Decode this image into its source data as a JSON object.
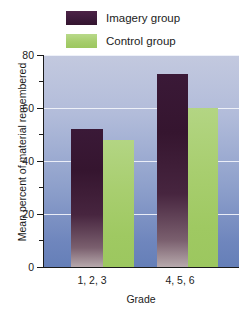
{
  "chart_data": {
    "type": "bar",
    "title": "",
    "xlabel": "Grade",
    "ylabel": "Mean percent of material remembered",
    "categories": [
      "1, 2, 3",
      "4, 5, 6"
    ],
    "series": [
      {
        "name": "Imagery group",
        "color": "#3a1937",
        "values": [
          52,
          73
        ]
      },
      {
        "name": "Control group",
        "color": "#a6cd6c",
        "values": [
          48,
          60
        ]
      }
    ],
    "ylim": [
      0,
      80
    ],
    "yticks": [
      0,
      20,
      40,
      60,
      80
    ],
    "ytick_labels": [
      "0",
      "20",
      "40",
      "60",
      "80"
    ],
    "yminor_ticks": [
      10,
      30,
      50,
      70
    ],
    "grid": true,
    "gridlines_at": [
      20,
      40,
      60,
      80
    ],
    "legend_position": "top-center",
    "plot_background": "blue-gradient"
  },
  "legend": {
    "items": [
      {
        "label": "Imagery group",
        "swatch": "imagery-swatch"
      },
      {
        "label": "Control group",
        "swatch": "control-swatch"
      }
    ]
  },
  "axes": {
    "y_title": "Mean percent of material remembered",
    "x_title": "Grade",
    "y_labels": {
      "t80": "80",
      "t60": "60",
      "t40": "40",
      "t20": "20",
      "t0": "0"
    },
    "x_labels": {
      "g1": "1, 2, 3",
      "g2": "4, 5, 6"
    }
  }
}
